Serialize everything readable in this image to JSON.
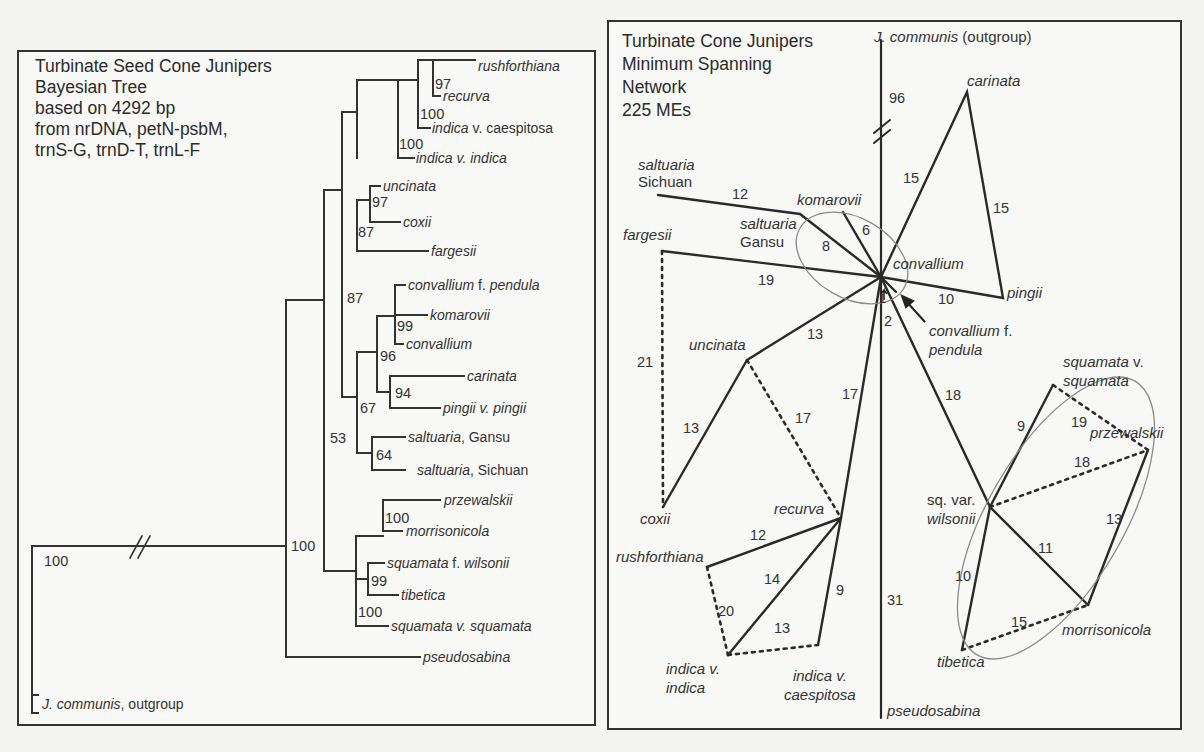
{
  "left_panel": {
    "title_lines": [
      "Turbinate Seed Cone Junipers",
      "Bayesian Tree",
      "based on 4292 bp",
      "from nrDNA, petN-psbM,",
      "trnS-G, trnD-T, trnL-F"
    ],
    "taxa": [
      {
        "italic": "rushforthiana",
        "plain": ""
      },
      {
        "italic": "recurva",
        "plain": ""
      },
      {
        "italic": "indica",
        "plain": " v. caespitosa"
      },
      {
        "italic": "indica v. indica",
        "plain": ""
      },
      {
        "italic": "uncinata",
        "plain": ""
      },
      {
        "italic": "coxii",
        "plain": ""
      },
      {
        "italic": "fargesii",
        "plain": ""
      },
      {
        "italic": "convallium",
        "plain": " f. ",
        "italic2": "pendula"
      },
      {
        "italic": "komarovii",
        "plain": ""
      },
      {
        "italic": "convallium",
        "plain": ""
      },
      {
        "italic": "carinata",
        "plain": ""
      },
      {
        "italic": "pingii v. pingii",
        "plain": ""
      },
      {
        "italic": "saltuaria",
        "plain": ", Gansu"
      },
      {
        "italic": "saltuaria",
        "plain": ", Sichuan"
      },
      {
        "italic": "przewalskii",
        "plain": ""
      },
      {
        "italic": "morrisonicola",
        "plain": ""
      },
      {
        "italic": "squamata",
        "plain": " f. ",
        "italic2": "wilsonii"
      },
      {
        "italic": "tibetica",
        "plain": ""
      },
      {
        "italic": "squamata v. squamata",
        "plain": ""
      },
      {
        "italic": "pseudosabina",
        "plain": ""
      },
      {
        "italic": "J. communis",
        "plain": ", outgroup"
      }
    ],
    "support_values": [
      "97",
      "100",
      "100",
      "97",
      "87",
      "87",
      "99",
      "96",
      "94",
      "67",
      "64",
      "53",
      "100",
      "99",
      "100",
      "100",
      "100"
    ]
  },
  "right_panel": {
    "title_lines": [
      "Turbinate Cone Junipers",
      "Minimum Spanning",
      "Network",
      "225 MEs"
    ],
    "node_labels": {
      "outgroup_italic": "J. communis",
      "outgroup_plain": " (outgroup)",
      "carinata": "carinata",
      "saltuaria_sichuan_1": "saltuaria",
      "saltuaria_sichuan_2": "Sichuan",
      "komarovii": "komarovii",
      "saltuaria_gansu_1": "saltuaria",
      "saltuaria_gansu_2": "Gansu",
      "fargesii": "fargesii",
      "convallium": "convallium",
      "pingii": "pingii",
      "convallium_pendula_1": "convallium",
      "convallium_pendula_1b": " f.",
      "convallium_pendula_2": "pendula",
      "uncinata": "uncinata",
      "squamata_1": "squamata",
      "squamata_1b": " v.",
      "squamata_2": "squamata",
      "przewalskii": "przewalskii",
      "wilsonii_1": "sq. var.",
      "wilsonii_2": "wilsonii",
      "coxii": "coxii",
      "recurva": "recurva",
      "rushforthiana": "rushforthiana",
      "indica_indica_1": "indica v.",
      "indica_indica_2": "indica",
      "caespitosa_1": "indica v.",
      "caespitosa_2": "caespitosa",
      "tibetica": "tibetica",
      "morrisonicola": "morrisonicola",
      "pseudosabina": "pseudosabina"
    },
    "edge_weights": {
      "outgroup": "96",
      "hub_carinata": "15",
      "carinata_pingii": "15",
      "sichuan_gansu": "12",
      "komarovii": "6",
      "gansu_hub": "8",
      "fargesii_hub": "19",
      "hub_pingii": "10",
      "pendula_1": "1",
      "pendula_2": "2",
      "fargesii_coxii": "21",
      "hub_uncinata": "13",
      "uncinata_coxii": "13",
      "uncinata_recurva": "17",
      "hub_recurva": "17",
      "hub_wilsonii": "18",
      "wilsonii_squamata": "9",
      "squamata_przewalskii": "19",
      "wilsonii_przewalskii": "18",
      "przewalskii_morrisonicola": "13",
      "wilsonii_morrisonicola": "11",
      "wilsonii_tibetica": "10",
      "tibetica_morrisonicola": "15",
      "recurva_rushforthiana": "12",
      "recurva_indica": "14",
      "rushforthiana_indica": "20",
      "indica_caespitosa": "13",
      "recurva_caespitosa": "9",
      "pseudosabina": "31"
    }
  }
}
